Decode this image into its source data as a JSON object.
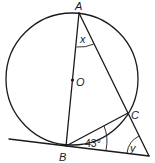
{
  "diagram": {
    "type": "circle-geometry",
    "points": {
      "A": {
        "label": "A",
        "x": 79,
        "y": 13
      },
      "O": {
        "label": "O",
        "x": 72,
        "y": 80
      },
      "B": {
        "label": "B",
        "x": 66,
        "y": 146
      },
      "C": {
        "label": "C",
        "x": 128,
        "y": 113
      },
      "T": {
        "label": "",
        "x": 149,
        "y": 156
      }
    },
    "circle": {
      "center": "O",
      "cx": 72,
      "cy": 79,
      "r": 66
    },
    "angles": {
      "x": {
        "label": "x",
        "vertex": "A"
      },
      "abc": {
        "label": "43°",
        "vertex": "B"
      },
      "y": {
        "label": "y",
        "vertex": "T"
      }
    },
    "segments": [
      "AB (diameter through O)",
      "AC extended to T",
      "BC",
      "tangent at B through T"
    ]
  }
}
